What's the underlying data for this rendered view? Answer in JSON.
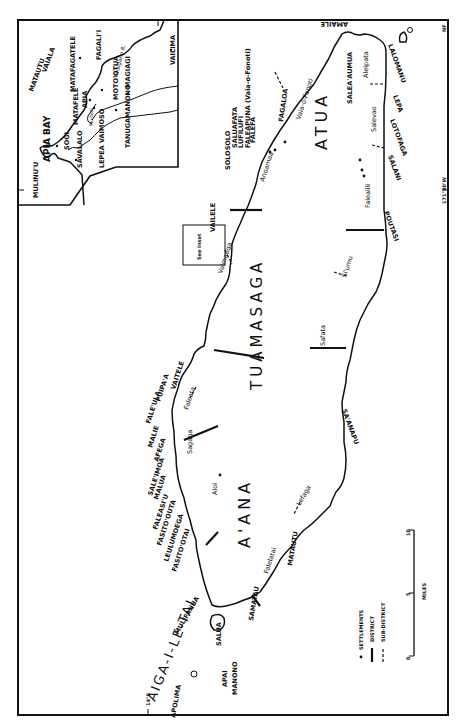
{
  "map": {
    "subject": "Upolu, Western Samoa — districts and settlements",
    "districts": {
      "aiga": "AIGA-I-LE-TAI",
      "aana": "A'ANA",
      "tuamasaga": "TUAMASAGA",
      "atua": "ATUA"
    },
    "north_coast": [
      "APOLIMA",
      "MANONO",
      "APAI",
      "SALUA",
      "MULIFANUA",
      "FASITO'OTAI",
      "LEULUMOEGA",
      "FASITO'OUTA",
      "FALEASI'U",
      "MALUA",
      "SALE'IMOA",
      "AFEGA",
      "MALIE",
      "FALE'ULA",
      "PUIPA'A",
      "VAITELE",
      "VAILELE",
      "SOLOSOLO",
      "SALUAFATA",
      "LUFILUFI",
      "FALEAPUNA (Vaia-o-Fonoti)",
      "FALEFA",
      "FAGALOA",
      "AMAILE",
      "SALEA'AUMUA"
    ],
    "south_coast": [
      "SAMATAU",
      "MATAUTU",
      "SA'ANAPU",
      "POUTASI",
      "SALANI",
      "LOTOFAGA",
      "LEPA",
      "LALOMANU"
    ],
    "subdistricts": [
      "Aleipata",
      "Salevao",
      "Falealili",
      "Si'umu",
      "Safata",
      "Lefaga",
      "Falelatai",
      "Aloi",
      "Sagaga",
      "Faleata",
      "Vaimauga",
      "Anoamaa",
      "Vaia-o-Fonoti"
    ],
    "see_inset_note": "See Inset",
    "grid_ticks": {
      "longitude": "171°40'W",
      "latitude": "14°S"
    },
    "corner_mark": "NF"
  },
  "inset": {
    "labels": {
      "mulinuu": "MULINU'U",
      "apia_bay": "APIA BAY",
      "matautu": "MATAUTU",
      "vaiala": "VAIALA",
      "matafagatele": "MATAFAGATELE",
      "fagalii": "FAGALI'I",
      "sogi": "SOGI",
      "matafele": "MATAFELE",
      "apia": "APIA",
      "savalalo": "SAVALALO",
      "mulivai": "Mulivai",
      "motootua": "MOTO'OTUA",
      "magiagi": "MAGIAGI",
      "vaisigano": "Vaisigano R.",
      "vailima": "VAILIMA",
      "lepea": "LEPEA",
      "vaimoso": "VAIMOSO",
      "tanugamanono": "TANUGAMANONO"
    }
  },
  "legend": {
    "settlements": "SETTLEMENTS",
    "district": "DISTRICT",
    "subdistrict": "SUB-DISTRICT"
  },
  "scale": {
    "ticks": [
      "0",
      "5",
      "10"
    ],
    "unit": "MILES"
  }
}
